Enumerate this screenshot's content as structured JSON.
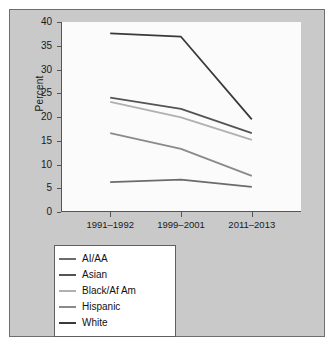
{
  "chart_data": {
    "type": "line",
    "title": "",
    "xlabel": "",
    "ylabel": "Percent",
    "categories": [
      "1991–1992",
      "1999–2001",
      "2011–2013"
    ],
    "ylim": [
      0,
      40
    ],
    "yticks": [
      0,
      5,
      10,
      15,
      20,
      25,
      30,
      35,
      40
    ],
    "grid": false,
    "legend_position": "below-plot",
    "series": [
      {
        "name": "AI/AA",
        "values": [
          6.3,
          6.8,
          5.3
        ],
        "color": "#6b6b6b"
      },
      {
        "name": "Asian",
        "values": [
          24.1,
          21.7,
          16.6
        ],
        "color": "#545454"
      },
      {
        "name": "Black/Af Am",
        "values": [
          23.2,
          19.9,
          15.2
        ],
        "color": "#b0b0b0"
      },
      {
        "name": "Hispanic",
        "values": [
          16.6,
          13.3,
          7.6
        ],
        "color": "#8a8a8a"
      },
      {
        "name": "White",
        "values": [
          37.6,
          36.9,
          19.5
        ],
        "color": "#3a3a3a"
      }
    ]
  },
  "axes": {
    "y_label": "Percent",
    "y_ticks": [
      "0",
      "5",
      "10",
      "15",
      "20",
      "25",
      "30",
      "35",
      "40"
    ],
    "x_ticks": [
      "1991–1992",
      "1999–2001",
      "2011–2013"
    ]
  },
  "legend": {
    "items": [
      {
        "label": "AI/AA"
      },
      {
        "label": "Asian"
      },
      {
        "label": "Black/Af Am"
      },
      {
        "label": "Hispanic"
      },
      {
        "label": "White"
      }
    ]
  },
  "colors": {
    "figure_background": "#c9c9c9",
    "plot_background": "#fbfbfb",
    "axis": "#555555",
    "text": "#1a1a1a"
  }
}
